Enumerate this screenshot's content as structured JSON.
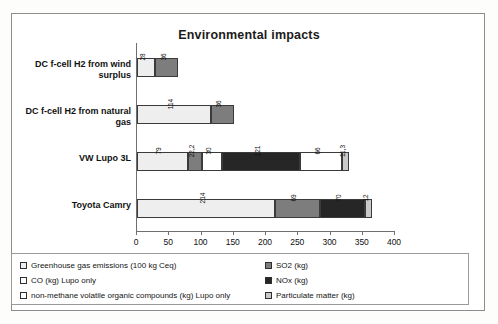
{
  "chart_data": {
    "type": "bar",
    "subtype": "horizontal-stacked",
    "title": "Environmental impacts",
    "xlabel": "",
    "ylabel": "",
    "xlim": [
      0,
      400
    ],
    "xticks": [
      "0",
      "50",
      "100",
      "150",
      "200",
      "250",
      "300",
      "350",
      "400"
    ],
    "grid": false,
    "legend_position": "bottom",
    "categories": [
      "DC f-cell H2 from wind surplus",
      "DC f-cell H2 from natural gas",
      "VW Lupo 3L",
      "Toyota Camry"
    ],
    "series": [
      {
        "name": "Greenhouse gas emissions (100 kg Ceq)",
        "color": "#eeeeee",
        "values": [
          28,
          114,
          79,
          214
        ]
      },
      {
        "name": "SO2 (kg)",
        "color": "#7d7d7d",
        "values": [
          36,
          36,
          22.2,
          69
        ]
      },
      {
        "name": "CO (kg) Lupo only",
        "color": "#ffffff",
        "values": [
          null,
          null,
          30,
          null
        ]
      },
      {
        "name": "NOx (kg)",
        "color": "#262626",
        "values": [
          null,
          null,
          121,
          70
        ]
      },
      {
        "name": "non-methane volatile organic compounds (kg) Lupo only",
        "color": "#ffffff",
        "values": [
          null,
          null,
          66,
          null
        ]
      },
      {
        "name": "Particulate matter (kg)",
        "color": "#c9c9c9",
        "values": [
          null,
          null,
          11.3,
          12
        ]
      }
    ],
    "bars": [
      {
        "category": "DC f-cell H2 from wind surplus",
        "segments": [
          {
            "series": "Greenhouse gas emissions (100 kg Ceq)",
            "value": 28,
            "label": "28",
            "color": "#eeeeee"
          },
          {
            "series": "SO2 (kg)",
            "value": 36,
            "label": "36",
            "color": "#7d7d7d"
          }
        ],
        "total": 64
      },
      {
        "category": "DC f-cell H2 from natural gas",
        "segments": [
          {
            "series": "Greenhouse gas emissions (100 kg Ceq)",
            "value": 114,
            "label": "114",
            "color": "#eeeeee"
          },
          {
            "series": "SO2 (kg)",
            "value": 36,
            "label": "36",
            "color": "#7d7d7d"
          }
        ],
        "total": 150
      },
      {
        "category": "VW Lupo 3L",
        "segments": [
          {
            "series": "Greenhouse gas emissions (100 kg Ceq)",
            "value": 79,
            "label": "79",
            "color": "#eeeeee"
          },
          {
            "series": "SO2 (kg)",
            "value": 22.2,
            "label": "22,2",
            "color": "#7d7d7d"
          },
          {
            "series": "CO (kg) Lupo only",
            "value": 30,
            "label": "30",
            "color": "#ffffff"
          },
          {
            "series": "NOx (kg)",
            "value": 121,
            "label": "121",
            "color": "#262626"
          },
          {
            "series": "non-methane volatile organic compounds (kg) Lupo only",
            "value": 66,
            "label": "66",
            "color": "#ffffff"
          },
          {
            "series": "Particulate matter (kg)",
            "value": 11.3,
            "label": "11,3",
            "color": "#c9c9c9"
          }
        ],
        "total": 329.5
      },
      {
        "category": "Toyota Camry",
        "segments": [
          {
            "series": "Greenhouse gas emissions (100 kg Ceq)",
            "value": 214,
            "label": "214",
            "color": "#eeeeee"
          },
          {
            "series": "SO2 (kg)",
            "value": 69,
            "label": "69",
            "color": "#7d7d7d"
          },
          {
            "series": "NOx (kg)",
            "value": 70,
            "label": "70",
            "color": "#262626"
          },
          {
            "series": "Particulate matter (kg)",
            "value": 12,
            "label": "12",
            "color": "#c9c9c9"
          }
        ],
        "total": 365
      }
    ],
    "legend": {
      "left_column": [
        {
          "label": "Greenhouse gas emissions (100 kg Ceq)",
          "color": "#eeeeee"
        },
        {
          "label": "CO (kg) Lupo only",
          "color": "#ffffff"
        },
        {
          "label": "non-methane volatile organic compounds (kg) Lupo only",
          "color": "#ffffff"
        }
      ],
      "right_column": [
        {
          "label": "SO2 (kg)",
          "color": "#7d7d7d"
        },
        {
          "label": "NOx (kg)",
          "color": "#262626"
        },
        {
          "label": "Particulate matter (kg)",
          "color": "#c9c9c9"
        }
      ]
    }
  }
}
